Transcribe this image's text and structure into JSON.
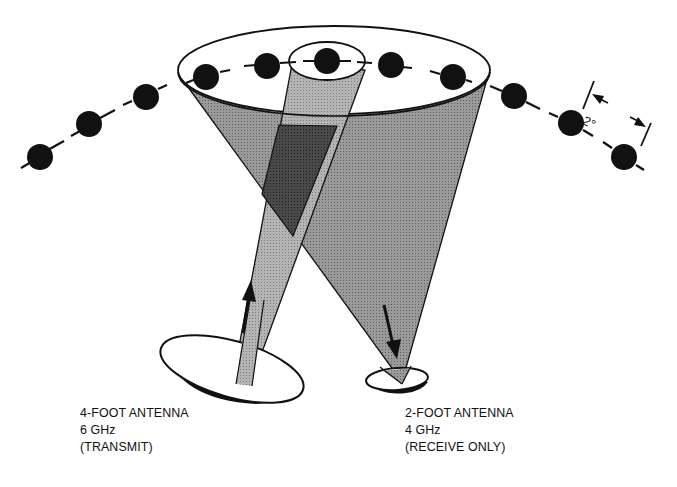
{
  "diagram": {
    "spacing_label": "2°",
    "colors": {
      "background": "#ffffff",
      "line": "#111111",
      "satellite": "#111111",
      "beam_light": "#a8a8a8",
      "beam_medium": "#8f8f8f",
      "beam_overlap": "#3a3a3a"
    },
    "transmit_antenna": {
      "lines": [
        "4-FOOT ANTENNA",
        "6 GHz",
        "(TRANSMIT)"
      ],
      "size": "4-foot",
      "frequency": "6 GHz",
      "mode": "TRANSMIT",
      "arrow_direction": "up"
    },
    "receive_antenna": {
      "lines": [
        "2-FOOT ANTENNA",
        "4 GHz",
        "(RECEIVE ONLY)"
      ],
      "size": "2-foot",
      "frequency": "4 GHz",
      "mode": "RECEIVE ONLY",
      "arrow_direction": "down"
    },
    "satellites_count": 11
  }
}
